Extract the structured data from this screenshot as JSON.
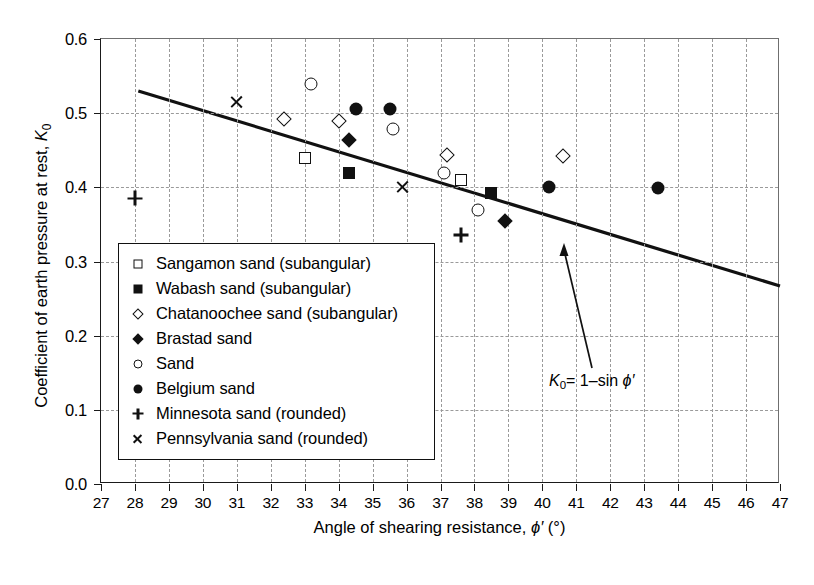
{
  "chart_data": {
    "type": "scatter",
    "title": "",
    "xlabel": "Angle of shearing resistance, ϕ′ (°)",
    "ylabel": "Coefficient of earth pressure at rest, K₀",
    "xlim": [
      27,
      47
    ],
    "ylim": [
      0.0,
      0.6
    ],
    "xticks": [
      27,
      28,
      29,
      30,
      31,
      32,
      33,
      34,
      35,
      36,
      37,
      38,
      39,
      40,
      41,
      42,
      43,
      44,
      45,
      46,
      47
    ],
    "yticks": [
      "0.0",
      "0.1",
      "0.2",
      "0.3",
      "0.4",
      "0.5",
      "0.6"
    ],
    "ytick_values": [
      0.0,
      0.1,
      0.2,
      0.3,
      0.4,
      0.5,
      0.6
    ],
    "grid": true,
    "grid_style": "dashed",
    "legend_position": "lower-left-inside",
    "annotation": {
      "text_parts": {
        "k": "K",
        "sub": "0",
        "eq": "= 1–sin ",
        "phi": "ϕ′"
      },
      "text": "K₀ = 1–sin ϕ′",
      "points_to": [
        39.8,
        0.372
      ]
    },
    "reference_line": {
      "label": "K₀ = 1–sin ϕ′",
      "x_start": 28.1,
      "y_start": 0.53,
      "x_end": 47.0,
      "y_end": 0.267
    },
    "series": [
      {
        "name": "Sangamon sand (subangular)",
        "marker": "open-square",
        "points": [
          [
            33.0,
            0.44
          ],
          [
            37.6,
            0.41
          ]
        ]
      },
      {
        "name": "Wabash sand (subangular)",
        "marker": "filled-square",
        "points": [
          [
            34.3,
            0.419
          ],
          [
            38.5,
            0.392
          ]
        ]
      },
      {
        "name": "Chatanoochee sand (subangular)",
        "marker": "open-diamond",
        "points": [
          [
            32.4,
            0.492
          ],
          [
            34.0,
            0.49
          ],
          [
            37.2,
            0.443
          ],
          [
            40.6,
            0.442
          ]
        ]
      },
      {
        "name": "Brastad sand",
        "marker": "filled-diamond",
        "points": [
          [
            34.3,
            0.464
          ],
          [
            38.9,
            0.355
          ]
        ]
      },
      {
        "name": "Sand",
        "marker": "open-circle",
        "points": [
          [
            33.2,
            0.54
          ],
          [
            35.6,
            0.478
          ],
          [
            37.1,
            0.42
          ],
          [
            38.1,
            0.369
          ]
        ]
      },
      {
        "name": "Belgium sand",
        "marker": "filled-circle",
        "points": [
          [
            34.5,
            0.505
          ],
          [
            35.5,
            0.505
          ],
          [
            40.2,
            0.4
          ],
          [
            43.4,
            0.399
          ]
        ]
      },
      {
        "name": "Minnesota sand (rounded)",
        "marker": "plus",
        "points": [
          [
            28.0,
            0.385
          ],
          [
            37.6,
            0.336
          ]
        ]
      },
      {
        "name": "Pennsylvania sand (rounded)",
        "marker": "cross",
        "points": [
          [
            31.0,
            0.515
          ],
          [
            35.9,
            0.4
          ]
        ]
      }
    ]
  },
  "colors": {
    "ink": "#111111",
    "grid": "#9a9a9a",
    "background": "#ffffff"
  }
}
